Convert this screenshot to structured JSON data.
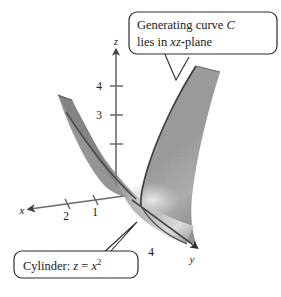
{
  "figure": {
    "background_color": "#ffffff",
    "surface": {
      "fill_color": "#9a9a9a",
      "shade_dark_color": "#787878",
      "shade_light_color": "#d8d8d8",
      "edge_color": "#3a3a3a"
    },
    "axes": {
      "line_color": "#5a5a5a",
      "x": {
        "label": "x",
        "ticks": [
          "2",
          "1"
        ]
      },
      "y": {
        "label": "y",
        "ticks": [
          "4"
        ]
      },
      "z": {
        "label": "z",
        "ticks": [
          "4",
          "3"
        ]
      }
    },
    "callouts": [
      {
        "name": "generating-curve",
        "line1": "Generating curve ",
        "line1_italic": "C",
        "line2_prefix": "lies in ",
        "line2_italic": "xz",
        "line2_suffix": "-plane",
        "border_color": "#2b2b2b",
        "fill_color": "#ffffff"
      },
      {
        "name": "cylinder-equation",
        "prefix": "Cylinder: ",
        "italic_z": "z",
        "equals": " = ",
        "italic_x": "x",
        "superscript": "2",
        "border_color": "#2b2b2b",
        "fill_color": "#ffffff"
      }
    ]
  }
}
